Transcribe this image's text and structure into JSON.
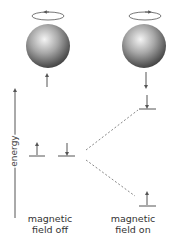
{
  "diagram": {
    "axis_label": "energy",
    "states": [
      {
        "id": "field-off",
        "label_line1": "magnetic",
        "label_line2": "field off"
      },
      {
        "id": "field-on",
        "label_line1": "magnetic",
        "label_line2": "field on"
      }
    ],
    "spheres": [
      {
        "id": "left",
        "rotation": "counterclockwise",
        "spin": "up"
      },
      {
        "id": "right",
        "rotation": "clockwise",
        "spin": "down"
      }
    ],
    "levels": {
      "field_off": [
        {
          "spin": "up"
        },
        {
          "spin": "down"
        }
      ],
      "field_on": [
        {
          "position": "higher",
          "spin": "down"
        },
        {
          "position": "lower",
          "spin": "up"
        }
      ]
    },
    "colors": {
      "line": "#555555",
      "sphere_light": "#f2f2f2",
      "sphere_dark": "#3a3a3a"
    }
  }
}
